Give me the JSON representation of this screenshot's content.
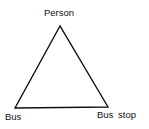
{
  "diagram": {
    "type": "triangle",
    "nodes": [
      {
        "id": "person",
        "label": "Person",
        "position": "top"
      },
      {
        "id": "bus",
        "label": "Bus",
        "position": "bottom-left"
      },
      {
        "id": "bus_stop",
        "label": "Bus stop",
        "position": "bottom-right"
      }
    ],
    "edges": [
      {
        "from": "person",
        "to": "bus"
      },
      {
        "from": "person",
        "to": "bus_stop"
      },
      {
        "from": "bus",
        "to": "bus_stop"
      }
    ],
    "stroke_color": "#111111"
  }
}
